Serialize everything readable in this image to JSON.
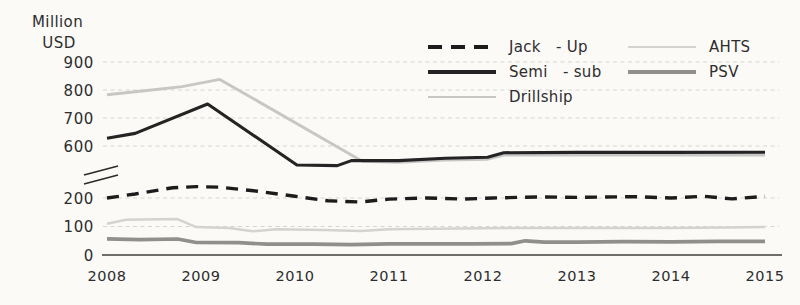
{
  "chart_data": {
    "type": "line",
    "title": "",
    "ylabel_lines": [
      "Million",
      "USD"
    ],
    "x_axis": {
      "ticks": [
        2008,
        2009,
        2010,
        2011,
        2012,
        2013,
        2014,
        2015
      ],
      "range": [
        2008,
        2015
      ]
    },
    "y_axis": {
      "unit": "Million USD",
      "tick_labels": [
        900,
        800,
        700,
        600,
        200,
        100,
        0
      ],
      "grid_ticks": [
        900,
        800,
        700,
        600,
        200,
        100
      ],
      "axis_break_between": [
        200,
        600
      ],
      "upper_range": [
        600,
        900
      ],
      "lower_range": [
        0,
        200
      ]
    },
    "grid": "dashed-horizontal",
    "legend_position": "top-center, two columns, no border",
    "series": [
      {
        "name": "Jack   - Up",
        "clean_name": "Jack-Up",
        "color": "#1c1c1c",
        "style": "dashed",
        "width": 3.4,
        "points": [
          [
            2008,
            200
          ],
          [
            2008.3,
            214
          ],
          [
            2008.7,
            236
          ],
          [
            2008.95,
            240
          ],
          [
            2009.2,
            238
          ],
          [
            2009.6,
            224
          ],
          [
            2010,
            206
          ],
          [
            2010.35,
            190
          ],
          [
            2010.7,
            186
          ],
          [
            2011,
            196
          ],
          [
            2011.4,
            200
          ],
          [
            2011.8,
            196
          ],
          [
            2012.1,
            200
          ],
          [
            2012.6,
            204
          ],
          [
            2013,
            202
          ],
          [
            2013.6,
            205
          ],
          [
            2014,
            200
          ],
          [
            2014.35,
            206
          ],
          [
            2014.65,
            197
          ],
          [
            2015,
            206
          ]
        ]
      },
      {
        "name": "Semi   - sub",
        "clean_name": "Semi-sub",
        "color": "#242424",
        "style": "solid",
        "width": 3.1,
        "points": [
          [
            2008,
            628
          ],
          [
            2008.3,
            645
          ],
          [
            2009.07,
            750
          ],
          [
            2010.02,
            532
          ],
          [
            2010.45,
            530
          ],
          [
            2010.6,
            548
          ],
          [
            2011.1,
            548
          ],
          [
            2011.6,
            556
          ],
          [
            2012.05,
            560
          ],
          [
            2012.22,
            576
          ],
          [
            2013,
            577
          ],
          [
            2014,
            577
          ],
          [
            2015,
            578
          ]
        ]
      },
      {
        "name": "Drillship",
        "clean_name": "Drillship",
        "color": "#c7c7c6",
        "style": "solid",
        "width": 2.9,
        "points": [
          [
            2008,
            783
          ],
          [
            2008.4,
            797
          ],
          [
            2008.8,
            812
          ],
          [
            2009.2,
            838
          ],
          [
            2010.72,
            545
          ],
          [
            2011.1,
            542
          ],
          [
            2011.6,
            550
          ],
          [
            2012.05,
            553
          ],
          [
            2012.22,
            568
          ],
          [
            2013,
            568
          ],
          [
            2014,
            568
          ],
          [
            2015,
            568
          ]
        ]
      },
      {
        "name": "AHTS",
        "clean_name": "AHTS",
        "color": "#d4d3d1",
        "style": "solid",
        "width": 2.5,
        "points": [
          [
            2008,
            110
          ],
          [
            2008.2,
            124
          ],
          [
            2008.75,
            126
          ],
          [
            2008.95,
            98
          ],
          [
            2009.3,
            95
          ],
          [
            2009.55,
            83
          ],
          [
            2009.8,
            90
          ],
          [
            2010.3,
            88
          ],
          [
            2010.7,
            84
          ],
          [
            2011,
            90
          ],
          [
            2011.5,
            92
          ],
          [
            2012,
            94
          ],
          [
            2013,
            95
          ],
          [
            2014,
            95
          ],
          [
            2014.6,
            97
          ],
          [
            2015,
            98
          ]
        ]
      },
      {
        "name": "PSV",
        "clean_name": "PSV",
        "color": "#8f8f8e",
        "style": "solid",
        "width": 3.7,
        "points": [
          [
            2008,
            57
          ],
          [
            2008.35,
            54
          ],
          [
            2008.75,
            56
          ],
          [
            2008.95,
            44
          ],
          [
            2009.4,
            43
          ],
          [
            2009.7,
            38
          ],
          [
            2010.2,
            38
          ],
          [
            2010.6,
            36
          ],
          [
            2011,
            39
          ],
          [
            2011.9,
            39
          ],
          [
            2012.3,
            40
          ],
          [
            2012.45,
            50
          ],
          [
            2012.65,
            45
          ],
          [
            2013,
            45
          ],
          [
            2013.5,
            47
          ],
          [
            2014,
            46
          ],
          [
            2014.5,
            48
          ],
          [
            2015,
            48
          ]
        ]
      }
    ],
    "colors": {
      "background": "#fbfaf7",
      "gridline": "#d6d5d2",
      "axis_line": "#3f3f3f",
      "text": "#2d2d2d"
    }
  }
}
